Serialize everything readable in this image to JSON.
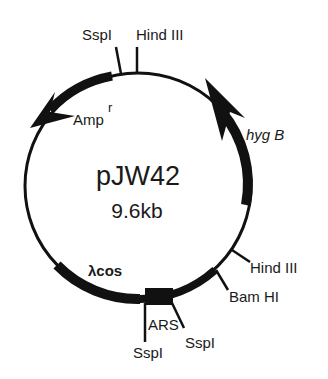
{
  "plasmid": {
    "name": "pJW42",
    "size": "9.6kb"
  },
  "genes": {
    "amp": {
      "label": "Amp",
      "superscript": "r"
    },
    "hyg": {
      "label": "hyg B"
    },
    "lambda_cos": {
      "label": "λcos"
    },
    "ars": {
      "label": "ARS"
    }
  },
  "sites": {
    "top_sspi": "SspI",
    "top_hindiii": "Hind III",
    "right_hindiii": "Hind III",
    "right_bamhi": "Bam HI",
    "bottom_sspi_left": "SspI",
    "bottom_sspi_right": "SspI"
  },
  "colors": {
    "ink": "#111111",
    "background": "#ffffff"
  }
}
